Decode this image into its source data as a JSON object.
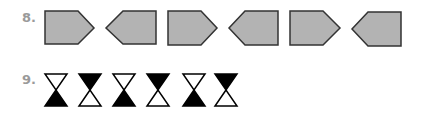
{
  "problems": [
    {
      "number": "8.",
      "shapes": [
        {
          "type": "pentagon",
          "direction": "right"
        },
        {
          "type": "pentagon",
          "direction": "left"
        },
        {
          "type": "pentagon",
          "direction": "right"
        },
        {
          "type": "pentagon",
          "direction": "left"
        },
        {
          "type": "pentagon",
          "direction": "right"
        },
        {
          "type": "pentagon",
          "direction": "left"
        }
      ],
      "fill_color": "#b3b3b3",
      "stroke_color": "#333333"
    },
    {
      "number": "9.",
      "shapes": [
        {
          "type": "hourglass",
          "filled": "bottom"
        },
        {
          "type": "hourglass",
          "filled": "top"
        },
        {
          "type": "hourglass",
          "filled": "bottom"
        },
        {
          "type": "hourglass",
          "filled": "top"
        },
        {
          "type": "hourglass",
          "filled": "bottom"
        },
        {
          "type": "hourglass",
          "filled": "top"
        }
      ],
      "fill_color": "#000000"
    }
  ]
}
